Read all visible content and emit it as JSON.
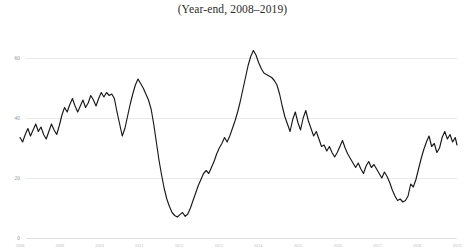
{
  "chart_data": {
    "type": "line",
    "title": "(Year-end, 2008–2019)",
    "xlabel": "",
    "ylabel": "",
    "ylim": [
      0,
      70
    ],
    "yticks": [
      60,
      40,
      20,
      0
    ],
    "ytick_labels": [
      "60",
      "40",
      "20",
      "0"
    ],
    "grid": true,
    "legend": "none",
    "line_color": "#18181a",
    "grid_color": "#e9e9ea",
    "xtick_labels": [
      "2008",
      "2009",
      "2010",
      "2011",
      "2012",
      "2013",
      "2014",
      "2015",
      "2016",
      "2017",
      "2018",
      "2019"
    ],
    "xtick_positions": [
      0,
      9.1,
      18.2,
      27.3,
      36.4,
      45.5,
      54.5,
      63.6,
      72.7,
      81.8,
      90.9,
      100
    ],
    "x": [
      0.0,
      0.6,
      1.2,
      1.8,
      2.4,
      3.0,
      3.6,
      4.2,
      4.8,
      5.4,
      6.0,
      6.6,
      7.2,
      7.8,
      8.4,
      9.0,
      9.6,
      10.2,
      10.8,
      11.4,
      12.0,
      12.6,
      13.2,
      13.8,
      14.4,
      15.0,
      15.6,
      16.2,
      16.8,
      17.4,
      18.0,
      18.6,
      19.2,
      19.8,
      20.4,
      21.0,
      21.6,
      22.2,
      22.8,
      23.4,
      24.0,
      24.6,
      25.2,
      25.8,
      26.4,
      27.0,
      27.6,
      28.2,
      28.8,
      29.4,
      30.0,
      30.6,
      31.2,
      31.8,
      32.4,
      33.0,
      33.6,
      34.2,
      34.8,
      35.4,
      36.0,
      36.6,
      37.2,
      37.8,
      38.4,
      39.0,
      39.6,
      40.2,
      40.8,
      41.4,
      42.0,
      42.6,
      43.2,
      43.8,
      44.4,
      45.0,
      45.6,
      46.2,
      46.8,
      47.4,
      48.0,
      48.6,
      49.2,
      49.8,
      50.4,
      51.0,
      51.6,
      52.2,
      52.8,
      53.4,
      54.0,
      54.6,
      55.2,
      55.8,
      56.4,
      57.0,
      57.6,
      58.2,
      58.8,
      59.4,
      60.0,
      60.6,
      61.2,
      61.8,
      62.4,
      63.0,
      63.6,
      64.2,
      64.8,
      65.4,
      66.0,
      66.6,
      67.2,
      67.8,
      68.4,
      69.0,
      69.6,
      70.2,
      70.8,
      71.4,
      72.0,
      72.6,
      73.2,
      73.8,
      74.4,
      75.0,
      75.6,
      76.2,
      76.8,
      77.4,
      78.0,
      78.6,
      79.2,
      79.8,
      80.4,
      81.0,
      81.6,
      82.2,
      82.8,
      83.4,
      84.0,
      84.6,
      85.2,
      85.8,
      86.4,
      87.0,
      87.6,
      88.2,
      88.8,
      89.4,
      90.0,
      90.6,
      91.2,
      91.8,
      92.4,
      93.0,
      93.6,
      94.2,
      94.8,
      95.4,
      96.0,
      96.6,
      97.2,
      97.8,
      98.4,
      99.0,
      99.6,
      100.0
    ],
    "y": [
      33.5,
      32.0,
      34.5,
      36.5,
      34.0,
      36.0,
      38.0,
      35.5,
      37.0,
      34.5,
      33.0,
      35.5,
      38.0,
      36.0,
      34.5,
      37.5,
      41.0,
      43.5,
      42.0,
      44.5,
      46.5,
      44.0,
      42.0,
      44.0,
      46.0,
      43.5,
      45.0,
      47.5,
      46.0,
      44.0,
      46.5,
      48.5,
      47.0,
      48.5,
      47.5,
      48.0,
      46.5,
      42.0,
      38.0,
      34.0,
      36.5,
      40.5,
      44.5,
      48.0,
      51.0,
      53.0,
      51.5,
      50.0,
      48.0,
      46.0,
      43.0,
      38.0,
      32.0,
      26.0,
      21.0,
      16.5,
      13.0,
      10.5,
      8.5,
      7.5,
      7.0,
      7.8,
      8.5,
      7.2,
      8.0,
      10.0,
      12.5,
      15.0,
      17.5,
      19.5,
      21.5,
      22.5,
      21.5,
      23.5,
      25.5,
      28.0,
      30.0,
      31.5,
      33.5,
      32.0,
      34.0,
      36.5,
      39.0,
      42.0,
      45.5,
      49.5,
      53.5,
      57.5,
      60.5,
      62.5,
      61.0,
      58.5,
      56.5,
      55.0,
      54.5,
      54.0,
      53.5,
      52.5,
      51.0,
      48.0,
      44.0,
      40.5,
      38.0,
      35.5,
      39.5,
      42.0,
      38.5,
      36.0,
      40.0,
      42.5,
      39.0,
      36.5,
      34.0,
      35.5,
      33.0,
      30.5,
      31.0,
      29.0,
      30.5,
      28.5,
      27.0,
      28.5,
      30.5,
      32.5,
      30.0,
      28.0,
      26.5,
      25.0,
      23.5,
      25.0,
      23.0,
      21.5,
      24.0,
      25.5,
      23.5,
      24.5,
      23.0,
      21.5,
      20.0,
      22.0,
      20.5,
      18.5,
      16.0,
      14.0,
      12.5,
      13.0,
      12.0,
      12.5,
      14.0,
      18.0,
      17.0,
      19.5,
      23.0,
      26.5,
      29.5,
      32.0,
      34.0,
      30.5,
      31.5,
      28.5,
      30.0,
      33.5,
      35.5,
      33.0,
      34.5,
      32.0,
      33.5,
      31.0,
      32.5,
      30.0,
      31.5,
      29.0,
      30.5,
      28.0,
      26.0,
      23.5,
      21.5,
      22.0,
      21.5,
      22.0
    ]
  }
}
